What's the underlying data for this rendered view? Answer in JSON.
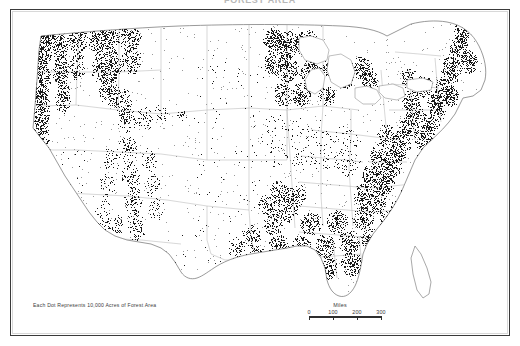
{
  "document": {
    "title_partial": "FOREST AREA",
    "canvas_width": 520,
    "canvas_height": 346,
    "background_color": "#ffffff",
    "frame_color": "#3a3a3a"
  },
  "map": {
    "subject": "United States forest area",
    "projection_note": "conterminous United States",
    "dot_color": "#1a1a1a",
    "boundary_color": "#9a9a9a",
    "coast_color": "#6e6e6e"
  },
  "legend": {
    "text": "Each Dot Represents 10,000 Acres of Forest Area",
    "dot_value": "10,000",
    "dot_unit": "Acres of Forest Area"
  },
  "scalebar": {
    "title": "Miles",
    "ticks": [
      "0",
      "100",
      "200",
      "300"
    ],
    "units": "Miles",
    "max_value": 300
  },
  "chart_data": {
    "type": "dot-density-map",
    "dot_represents": 10000,
    "dot_unit": "acres",
    "regions": [
      {
        "name": "Pacific Northwest coast and Cascades",
        "density": "very high"
      },
      {
        "name": "Northern California coast ranges and Sierra Nevada",
        "density": "high"
      },
      {
        "name": "Northern Rockies (Idaho, western Montana)",
        "density": "high"
      },
      {
        "name": "Central and southern Rockies (Colorado, New Mexico)",
        "density": "moderate"
      },
      {
        "name": "Great Basin and Southwest deserts",
        "density": "very low"
      },
      {
        "name": "Great Plains (Dakotas, Nebraska, Kansas, west Texas)",
        "density": "very low"
      },
      {
        "name": "Northern Great Lakes (Minnesota, Wisconsin, Michigan)",
        "density": "very high"
      },
      {
        "name": "Appalachian Mountains",
        "density": "very high"
      },
      {
        "name": "Southeast coastal plain and Gulf states",
        "density": "very high"
      },
      {
        "name": "Ozarks and Ouachitas (Missouri, Arkansas)",
        "density": "high"
      },
      {
        "name": "East Texas piney woods",
        "density": "high"
      },
      {
        "name": "Northern New England (Maine, New Hampshire)",
        "density": "very high"
      },
      {
        "name": "Florida peninsula",
        "density": "moderate"
      },
      {
        "name": "Corn Belt (Iowa, Illinois, Indiana)",
        "density": "low"
      }
    ]
  }
}
